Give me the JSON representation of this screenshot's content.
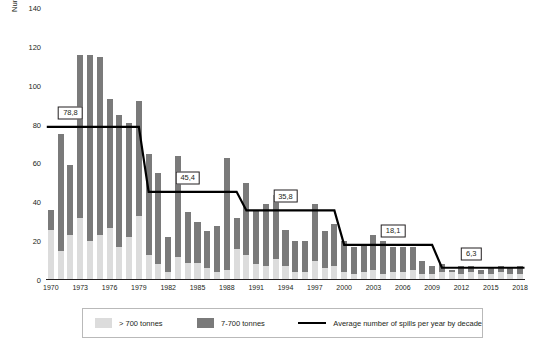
{
  "chart_data": {
    "type": "bar",
    "title": "",
    "subtitle": "",
    "xlabel": "",
    "ylabel": "Number of spills",
    "ylim": [
      0,
      140
    ],
    "yticks": [
      0,
      20,
      40,
      60,
      80,
      100,
      120,
      140
    ],
    "xticks": [
      "1970",
      "1973",
      "1976",
      "1979",
      "1982",
      "1985",
      "1988",
      "1991",
      "1994",
      "1997",
      "2000",
      "2003",
      "2006",
      "2009",
      "2012",
      "2015",
      "2018"
    ],
    "grid": false,
    "legend_position": "bottom",
    "stacked": true,
    "categories": [
      "1970",
      "1971",
      "1972",
      "1973",
      "1974",
      "1975",
      "1976",
      "1977",
      "1978",
      "1979",
      "1980",
      "1981",
      "1982",
      "1983",
      "1984",
      "1985",
      "1986",
      "1987",
      "1988",
      "1989",
      "1990",
      "1991",
      "1992",
      "1993",
      "1994",
      "1995",
      "1996",
      "1997",
      "1998",
      "1999",
      "2000",
      "2001",
      "2002",
      "2003",
      "2004",
      "2005",
      "2006",
      "2007",
      "2008",
      "2009",
      "2010",
      "2011",
      "2012",
      "2013",
      "2014",
      "2015",
      "2016",
      "2017",
      "2018"
    ],
    "series": [
      {
        "name": "> 700 tonnes",
        "color": "#dcdcdc",
        "values": [
          26,
          15,
          23,
          32,
          20,
          23,
          27,
          17,
          22,
          33,
          13,
          8,
          4,
          12,
          9,
          9,
          6,
          4,
          5,
          16,
          13,
          8,
          7,
          11,
          7,
          4,
          4,
          10,
          6,
          7,
          4,
          3,
          4,
          5,
          3,
          4,
          4,
          5,
          3,
          3,
          4,
          4,
          3,
          4,
          3,
          3,
          4,
          3,
          3
        ]
      },
      {
        "name": "7-700 tonnes",
        "color": "#7a7a7a",
        "values": [
          10,
          60,
          36,
          84,
          96,
          92,
          66,
          68,
          59,
          59,
          52,
          47,
          18,
          52,
          26,
          21,
          19,
          24,
          58,
          16,
          37,
          28,
          32,
          33,
          19,
          16,
          16,
          29,
          19,
          22,
          16,
          14,
          14,
          18,
          17,
          13,
          13,
          12,
          7,
          4,
          4,
          1,
          4,
          3,
          2,
          3,
          3,
          3,
          4
        ]
      }
    ],
    "totals": [
      36,
      75,
      59,
      116,
      116,
      115,
      93,
      85,
      81,
      92,
      65,
      55,
      22,
      64,
      35,
      30,
      25,
      28,
      63,
      32,
      50,
      36,
      39,
      44,
      26,
      20,
      20,
      39,
      25,
      29,
      20,
      17,
      18,
      23,
      20,
      17,
      17,
      17,
      10,
      7,
      8,
      5,
      7,
      7,
      5,
      6,
      7,
      6,
      7
    ],
    "average_line": {
      "name": "Average number of spills per year by decade",
      "color": "#000000",
      "steps": [
        {
          "label": "78,8",
          "value": 78.8,
          "start": "1970",
          "end": "1979",
          "callout_anchor": "1972"
        },
        {
          "label": "45,4",
          "value": 45.4,
          "start": "1980",
          "end": "1989",
          "callout_anchor": "1984"
        },
        {
          "label": "35,8",
          "value": 35.8,
          "start": "1990",
          "end": "1999",
          "callout_anchor": "1994"
        },
        {
          "label": "18,1",
          "value": 18.1,
          "start": "2000",
          "end": "2009",
          "callout_anchor": "2005"
        },
        {
          "label": "6,3",
          "value": 6.3,
          "start": "2010",
          "end": "2018",
          "callout_anchor": "2013"
        }
      ]
    }
  },
  "legend": {
    "items": [
      {
        "label": "> 700 tonnes",
        "swatch": "light-gray-swatch"
      },
      {
        "label": "7-700 tonnes",
        "swatch": "dark-gray-swatch"
      },
      {
        "label": "Average number of spills per year by decade",
        "swatch": "black-line-swatch"
      }
    ]
  }
}
